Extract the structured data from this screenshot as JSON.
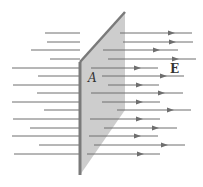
{
  "diagram": {
    "labels": {
      "surface": "A",
      "field": "E"
    },
    "colors": {
      "line": "#6e6e6e",
      "plane_fill": "#c4c4c4",
      "plane_edge": "#7a7a7a",
      "label": "#333333"
    },
    "plane": {
      "left_x": 80,
      "right_x": 125,
      "left_top": 62,
      "left_bottom": 175,
      "right_top": 12,
      "right_bottom": 110
    },
    "field_lines": [
      {
        "y": 33,
        "x_start": 45,
        "x_resume": 120,
        "x_end": 192,
        "arrow_x": 173
      },
      {
        "y": 42,
        "x_start": 47,
        "x_resume": 123,
        "x_end": 193,
        "arrow_x": 174
      },
      {
        "y": 50,
        "x_start": 31,
        "x_resume": 103,
        "x_end": 178,
        "arrow_x": 158
      },
      {
        "y": 59,
        "x_start": 50,
        "x_resume": 108,
        "x_end": 196,
        "arrow_x": 177
      },
      {
        "y": 68,
        "x_start": 12,
        "x_resume": 91,
        "x_end": 158,
        "arrow_x": 139
      },
      {
        "y": 76,
        "x_start": 38,
        "x_resume": 102,
        "x_end": 184,
        "arrow_x": 165
      },
      {
        "y": 85,
        "x_start": 13,
        "x_resume": 108,
        "x_end": 159,
        "arrow_x": 141
      },
      {
        "y": 93,
        "x_start": 37,
        "x_resume": 91,
        "x_end": 183,
        "arrow_x": 163
      },
      {
        "y": 102,
        "x_start": 12,
        "x_resume": 102,
        "x_end": 160,
        "arrow_x": 141
      },
      {
        "y": 110,
        "x_start": 44,
        "x_resume": 117,
        "x_end": 191,
        "arrow_x": 172
      },
      {
        "y": 119,
        "x_start": 13,
        "x_resume": 90,
        "x_end": 160,
        "arrow_x": 141
      },
      {
        "y": 128,
        "x_start": 30,
        "x_resume": 104,
        "x_end": 177,
        "arrow_x": 157
      },
      {
        "y": 136,
        "x_start": 12,
        "x_resume": 89,
        "x_end": 158,
        "arrow_x": 139
      },
      {
        "y": 145,
        "x_start": 39,
        "x_resume": 94,
        "x_end": 185,
        "arrow_x": 166
      },
      {
        "y": 154,
        "x_start": 14,
        "x_resume": 87,
        "x_end": 160,
        "arrow_x": 142
      }
    ]
  }
}
